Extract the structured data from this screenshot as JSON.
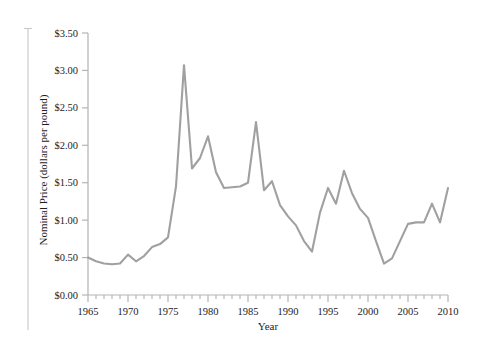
{
  "chart_data": {
    "type": "line",
    "title": "",
    "xlabel": "Year",
    "ylabel": "Nominal Price (dollars per pound)",
    "xlim": [
      1965,
      2010
    ],
    "ylim": [
      0.0,
      3.5
    ],
    "grid": false,
    "legend": "none",
    "line_color": "#a0a0a0",
    "axis_color": "#b4b4b4",
    "text_color": "#1d1d1d",
    "y_tick_labels": [
      "$0.00",
      "$0.50",
      "$1.00",
      "$1.50",
      "$2.00",
      "$2.50",
      "$3.00",
      "$3.50"
    ],
    "y_tick_values": [
      0.0,
      0.5,
      1.0,
      1.5,
      2.0,
      2.5,
      3.0,
      3.5
    ],
    "x_tick_labels": [
      "1965",
      "1970",
      "1975",
      "1980",
      "1985",
      "1990",
      "1995",
      "2000",
      "2005",
      "2010"
    ],
    "x_tick_values": [
      1965,
      1970,
      1975,
      1980,
      1985,
      1990,
      1995,
      2000,
      2005,
      2010
    ],
    "x_minor_tick_interval": 1,
    "series": [
      {
        "name": "Nominal Price",
        "x": [
          1965,
          1966,
          1967,
          1968,
          1969,
          1970,
          1971,
          1972,
          1973,
          1974,
          1975,
          1976,
          1977,
          1978,
          1979,
          1980,
          1981,
          1982,
          1983,
          1984,
          1985,
          1986,
          1987,
          1988,
          1989,
          1990,
          1991,
          1992,
          1993,
          1994,
          1995,
          1996,
          1997,
          1998,
          1999,
          2000,
          2001,
          2002,
          2003,
          2004,
          2005,
          2006,
          2007,
          2008,
          2009,
          2010
        ],
        "values": [
          0.5,
          0.45,
          0.42,
          0.41,
          0.42,
          0.54,
          0.45,
          0.52,
          0.64,
          0.68,
          0.77,
          1.45,
          3.07,
          1.69,
          1.83,
          2.12,
          1.64,
          1.43,
          1.44,
          1.45,
          1.5,
          2.31,
          1.4,
          1.52,
          1.2,
          1.05,
          0.93,
          0.72,
          0.58,
          1.1,
          1.43,
          1.22,
          1.66,
          1.36,
          1.15,
          1.03,
          0.72,
          0.42,
          0.49,
          0.72,
          0.95,
          0.97,
          0.97,
          1.22,
          0.97,
          1.43
        ]
      }
    ]
  }
}
